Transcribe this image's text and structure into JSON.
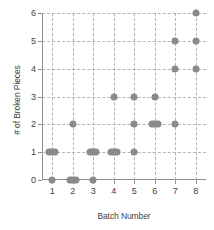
{
  "chart_data": {
    "type": "scatter",
    "title": "",
    "xlabel": "Batch Number",
    "ylabel": "# of Broken Pieces",
    "xlim": [
      0.5,
      8.5
    ],
    "ylim": [
      0,
      6
    ],
    "xticks": [
      "1",
      "2",
      "3",
      "4",
      "5",
      "6",
      "7",
      "8"
    ],
    "yticks": [
      "0",
      "1",
      "2",
      "3",
      "4",
      "5",
      "6"
    ],
    "grid": true,
    "legend": null,
    "marker_color": "#8a8a8a",
    "axis_color": "#8d8d8d",
    "grid_color": "#b3b3b3",
    "points": [
      {
        "x": 1,
        "y": 1,
        "count": 2
      },
      {
        "x": 1,
        "y": 0,
        "count": 1
      },
      {
        "x": 2,
        "y": 2,
        "count": 1
      },
      {
        "x": 2,
        "y": 0,
        "count": 2
      },
      {
        "x": 3,
        "y": 1,
        "count": 2
      },
      {
        "x": 3,
        "y": 0,
        "count": 1
      },
      {
        "x": 4,
        "y": 3,
        "count": 1
      },
      {
        "x": 4,
        "y": 1,
        "count": 2
      },
      {
        "x": 5,
        "y": 3,
        "count": 1
      },
      {
        "x": 5,
        "y": 2,
        "count": 1
      },
      {
        "x": 5,
        "y": 1,
        "count": 1
      },
      {
        "x": 6,
        "y": 3,
        "count": 1
      },
      {
        "x": 6,
        "y": 2,
        "count": 2
      },
      {
        "x": 7,
        "y": 5,
        "count": 1
      },
      {
        "x": 7,
        "y": 4,
        "count": 1
      },
      {
        "x": 7,
        "y": 2,
        "count": 1
      },
      {
        "x": 8,
        "y": 6,
        "count": 1
      },
      {
        "x": 8,
        "y": 5,
        "count": 1
      },
      {
        "x": 8,
        "y": 4,
        "count": 1
      }
    ]
  }
}
